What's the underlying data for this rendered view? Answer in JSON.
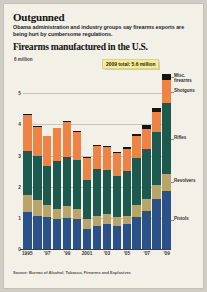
{
  "article": {
    "headline": "Outgunned",
    "deck": "Obama administration and industry groups say firearms exports are being hurt by cumbersome regulations."
  },
  "source_note": "Source: Bureau of Alcohol, Tobacco, Firearms and Explosives",
  "callout": {
    "text": "2009 total: 5.6 million"
  },
  "chart_data": {
    "type": "bar",
    "stacked": true,
    "title": "Firearms manufactured in the U.S.",
    "unit_label": "6 million",
    "xlabel": "",
    "ylabel": "millions of firearms",
    "ylim": [
      0,
      6
    ],
    "grid": true,
    "legend_position": "right",
    "yticks": [
      5,
      4,
      3,
      2,
      1
    ],
    "ytick_labels": [
      "5",
      "4",
      "3",
      "2",
      "1"
    ],
    "zero_label": "0",
    "categories": [
      1995,
      1996,
      1997,
      1998,
      1999,
      2000,
      2001,
      2002,
      2003,
      2004,
      2005,
      2006,
      2007,
      2008,
      2009
    ],
    "xtick_labels": [
      "1995",
      "'97",
      "'99",
      "2001",
      "'03",
      "'05",
      "'07",
      "'09"
    ],
    "xtick_categories": [
      1995,
      1997,
      1999,
      2001,
      2003,
      2005,
      2007,
      2009
    ],
    "series": [
      {
        "name": "Pistols",
        "color": "#2b5288",
        "values": [
          1.2,
          1.07,
          1.04,
          0.96,
          1.0,
          0.96,
          0.63,
          0.74,
          0.81,
          0.73,
          0.8,
          1.02,
          1.22,
          1.61,
          1.87
        ]
      },
      {
        "name": "Revolvers",
        "color": "#b9a469",
        "values": [
          0.53,
          0.5,
          0.37,
          0.33,
          0.38,
          0.32,
          0.32,
          0.32,
          0.31,
          0.29,
          0.27,
          0.39,
          0.39,
          0.43,
          0.55
        ]
      },
      {
        "name": "Rifles",
        "color": "#1c5a4f",
        "values": [
          1.41,
          1.42,
          1.25,
          1.54,
          1.57,
          1.58,
          1.28,
          1.51,
          1.43,
          1.33,
          1.43,
          1.5,
          1.61,
          1.73,
          2.25
        ]
      },
      {
        "name": "Shotguns",
        "color": "#ef8345",
        "values": [
          1.17,
          0.93,
          0.96,
          1.04,
          1.14,
          0.9,
          0.68,
          0.74,
          0.73,
          0.73,
          0.71,
          0.71,
          0.64,
          0.63,
          0.75
        ]
      },
      {
        "name": "Misc. firearms",
        "color": "#141414",
        "values": [
          0.02,
          0.02,
          0.02,
          0.02,
          0.03,
          0.03,
          0.03,
          0.03,
          0.04,
          0.04,
          0.06,
          0.08,
          0.12,
          0.14,
          0.19
        ]
      }
    ],
    "totals": [
      4.33,
      3.94,
      3.64,
      3.89,
      4.12,
      3.79,
      2.94,
      3.34,
      3.32,
      3.12,
      3.27,
      3.7,
      3.98,
      4.54,
      5.61
    ],
    "legend_labels": [
      "Misc.\nfirearms",
      "Shotguns",
      "Rifles",
      "Revolvers",
      "Pistols"
    ]
  }
}
